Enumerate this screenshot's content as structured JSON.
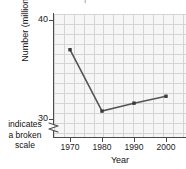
{
  "chart_data": {
    "type": "line",
    "title": "",
    "xlabel": "Year",
    "ylabel": "Number (millions)",
    "x": [
      1970,
      1980,
      1990,
      2000
    ],
    "categories": [
      "1970",
      "1980",
      "1990",
      "2000"
    ],
    "values": [
      37.0,
      30.8,
      31.6,
      32.3
    ],
    "series": [
      {
        "name": "Number (millions)",
        "values": [
          37.0,
          30.8,
          31.6,
          32.3
        ]
      }
    ],
    "xlim": [
      1965,
      2008
    ],
    "ylim": [
      30,
      42.4
    ],
    "y_ticks": [
      30,
      40
    ],
    "y_tick_labels": [
      "30",
      "40"
    ],
    "x_ticks": [
      1970,
      1980,
      1990,
      2000
    ],
    "x_tick_labels": [
      "1970",
      "1980",
      "1990",
      "2000"
    ],
    "grid": true,
    "grid_spacing": 1,
    "legend": "none",
    "broken_axis": "y",
    "annotations": [
      {
        "text": "indicates a broken scale",
        "lines": [
          "indicates",
          "a broken",
          "scale"
        ],
        "target": "y-axis-break"
      }
    ],
    "marker": "square",
    "line_color": "#555555",
    "marker_color": "#3a3a3a",
    "grid_color": "#c9c9c9",
    "plot_background": "#f4f4f4",
    "axis_color": "#4a4a4a"
  },
  "axes": {
    "y": {
      "title": "Number (millions)",
      "tick_labels": [
        "40",
        "30"
      ]
    },
    "x": {
      "title": "Year",
      "tick_labels": [
        "1970",
        "1980",
        "1990",
        "2000"
      ]
    }
  },
  "break_note": {
    "line1": "indicates",
    "line2": "a broken",
    "line3": "scale"
  },
  "clipped_title": "|"
}
